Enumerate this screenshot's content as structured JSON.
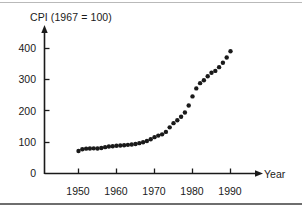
{
  "chart_data": {
    "type": "scatter",
    "title": "",
    "ylabel": "CPI (1967 = 100)",
    "xlabel": "Year",
    "xlim": [
      1944,
      1996
    ],
    "ylim": [
      0,
      430
    ],
    "grid": false,
    "legend": null,
    "xticks": [
      1950,
      1960,
      1970,
      1980,
      1990
    ],
    "xtick_labels": [
      "1950",
      "1960",
      "1970",
      "1980",
      "1990"
    ],
    "yticks": [
      0,
      100,
      200,
      300,
      400
    ],
    "ytick_labels": [
      "0",
      "100",
      "200",
      "300",
      "400"
    ],
    "marker": "filled-circle",
    "marker_color": "#1a1a1a",
    "x": [
      1950,
      1951,
      1952,
      1953,
      1954,
      1955,
      1956,
      1957,
      1958,
      1959,
      1960,
      1961,
      1962,
      1963,
      1964,
      1965,
      1966,
      1967,
      1968,
      1969,
      1970,
      1971,
      1972,
      1973,
      1974,
      1975,
      1976,
      1977,
      1978,
      1979,
      1980,
      1981,
      1982,
      1983,
      1984,
      1985,
      1986,
      1987,
      1988,
      1989,
      1990
    ],
    "values": [
      72.1,
      77.8,
      79.5,
      80.1,
      80.5,
      80.2,
      81.4,
      84.3,
      86.6,
      87.3,
      88.7,
      89.6,
      90.6,
      91.7,
      92.9,
      94.5,
      97.2,
      100.0,
      104.2,
      109.8,
      116.3,
      121.3,
      125.3,
      133.1,
      147.7,
      161.2,
      170.5,
      181.5,
      195.4,
      217.4,
      246.8,
      272.4,
      289.1,
      298.4,
      311.1,
      322.2,
      328.4,
      340.4,
      354.3,
      371.3,
      391.4
    ]
  },
  "axes": {
    "y_arrow": true,
    "x_arrow": true,
    "axis_color": "#1a1a1a"
  }
}
